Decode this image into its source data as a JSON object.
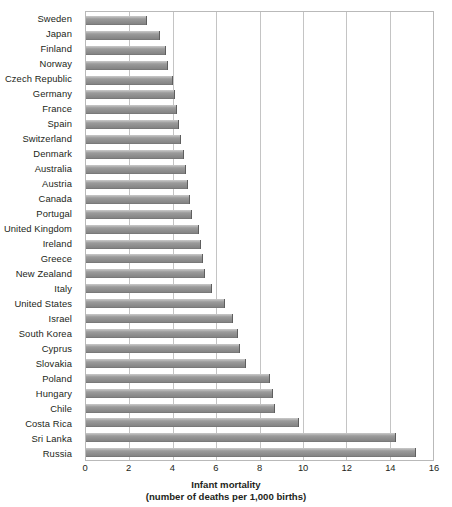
{
  "chart_data": {
    "type": "bar",
    "orientation": "horizontal",
    "title": "",
    "xlabel": "Infant mortality",
    "xlabel_sub": "(number of deaths per 1,000 births)",
    "ylabel": "",
    "xlim": [
      0,
      16
    ],
    "xticks": [
      0,
      2,
      4,
      6,
      8,
      10,
      12,
      14,
      16
    ],
    "grid": true,
    "legend": false,
    "bar_color": "#8f8f8f",
    "categories": [
      "Sweden",
      "Japan",
      "Finland",
      "Norway",
      "Czech Republic",
      "Germany",
      "France",
      "Spain",
      "Switzerland",
      "Denmark",
      "Australia",
      "Austria",
      "Canada",
      "Portugal",
      "United Kingdom",
      "Ireland",
      "Greece",
      "New Zealand",
      "Italy",
      "United States",
      "Israel",
      "South Korea",
      "Cyprus",
      "Slovakia",
      "Poland",
      "Hungary",
      "Chile",
      "Costa Rica",
      "Sri Lanka",
      "Russia"
    ],
    "values": [
      2.8,
      3.4,
      3.7,
      3.8,
      4.0,
      4.1,
      4.2,
      4.3,
      4.4,
      4.5,
      4.6,
      4.7,
      4.8,
      4.9,
      5.2,
      5.3,
      5.4,
      5.5,
      5.8,
      6.4,
      6.8,
      7.0,
      7.1,
      7.4,
      8.5,
      8.6,
      8.7,
      9.8,
      14.3,
      15.2
    ]
  }
}
